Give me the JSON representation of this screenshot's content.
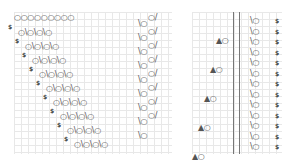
{
  "chart": {
    "left_section": {
      "top_row": "○○○○○○○○○",
      "rows": [
        {
          "marker": "$",
          "pattern": "○\\○\\○\\○",
          "right": "\\○○/"
        },
        {
          "marker": "$",
          "pattern": "○\\○\\○\\○",
          "right": "\\○○/"
        },
        {
          "marker": "$",
          "pattern": "○\\○\\○\\○",
          "right": "\\○○/"
        },
        {
          "marker": "$",
          "pattern": "○\\○\\○\\○",
          "right": "\\○○/"
        },
        {
          "marker": "$",
          "pattern": "○\\○\\○\\○",
          "right": "\\○○/"
        },
        {
          "marker": "$",
          "pattern": "○\\○\\○\\○",
          "right": "\\○○/"
        },
        {
          "marker": "$",
          "pattern": "○\\○\\○\\○",
          "right": "\\○○/"
        },
        {
          "marker": "$",
          "pattern": "○\\○\\○\\○",
          "right": "\\○○/"
        },
        {
          "marker": "$",
          "pattern": "○\\○\\○\\○",
          "right": "\\○"
        }
      ]
    },
    "right_section": {
      "triangle_rows": [
        "▲○",
        "▲○",
        "▲○",
        "▲○",
        "▲○"
      ],
      "rows": [
        {
          "sym": "\\○",
          "marker": "$"
        },
        {
          "sym": "\\○",
          "marker": "$"
        },
        {
          "sym": "\\○",
          "marker": "$"
        },
        {
          "sym": "\\○",
          "marker": "$"
        },
        {
          "sym": "\\○",
          "marker": "$"
        },
        {
          "sym": "\\○",
          "marker": "$"
        },
        {
          "sym": "\\○",
          "marker": "$"
        },
        {
          "sym": "\\○",
          "marker": "$"
        },
        {
          "sym": "\\○",
          "marker": "$"
        },
        {
          "sym": "\\○",
          "marker": "$"
        },
        {
          "sym": "\\○",
          "marker": "$"
        },
        {
          "sym": "\\○",
          "marker": "$"
        },
        {
          "sym": "\\○",
          "marker": "$"
        }
      ]
    }
  }
}
